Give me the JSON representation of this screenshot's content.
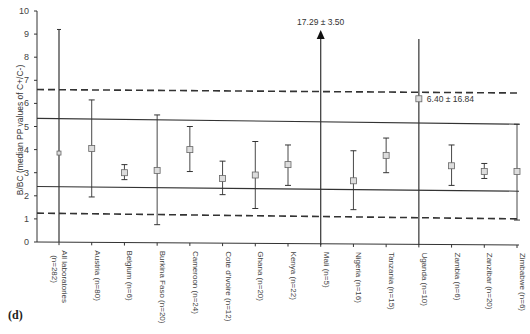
{
  "panel_label": "(d)",
  "chart_data": {
    "type": "scatter",
    "subtype": "point-with-error-bars",
    "title": "",
    "xlabel": "",
    "ylabel": "B/BC (median PP values of C+/C-)",
    "ylim": [
      0,
      10
    ],
    "yticks": [
      0,
      1,
      2,
      3,
      4,
      5,
      6,
      7,
      8,
      9,
      10
    ],
    "grid": false,
    "categories": [
      "All laboratories (n=282)",
      "Austria (n=80)",
      "Belgium (n=6)",
      "Burkina Faso (n=20)",
      "Cameroon (n=24)",
      "Cote d'Ivoire (n=12)",
      "Ghana (n=20)",
      "Kenya (n=22)",
      "Mali (n=5)",
      "Nigeria (n=16)",
      "Tanzania (n=15)",
      "Uganda (n=10)",
      "Zambia (n=6)",
      "Zanzibar (n=20)",
      "Zimbabwe (n=6)"
    ],
    "values": [
      3.85,
      4.05,
      3.0,
      3.1,
      4.0,
      2.75,
      2.9,
      3.35,
      17.29,
      2.65,
      3.75,
      6.2,
      3.3,
      3.05,
      3.05
    ],
    "err_low": [
      0.0,
      1.95,
      2.7,
      0.75,
      3.05,
      2.05,
      1.45,
      2.45,
      13.79,
      1.4,
      3.0,
      0.0,
      2.45,
      2.75,
      0.95
    ],
    "err_high": [
      9.2,
      6.15,
      3.35,
      5.5,
      5.0,
      3.5,
      4.35,
      4.2,
      10.0,
      3.95,
      4.5,
      10.0,
      4.2,
      3.4,
      5.1
    ],
    "annotations": [
      {
        "category": "Mali (n=5)",
        "text": "17.29 ± 3.50",
        "note": "off-scale, shown with arrow"
      },
      {
        "category": "Uganda (n=10)",
        "text": "6.40 ± 16.84"
      }
    ],
    "reference_lines": [
      {
        "style": "dashed",
        "y_start": 6.6,
        "y_end": 6.45
      },
      {
        "style": "solid",
        "y_start": 5.35,
        "y_end": 5.1
      },
      {
        "style": "solid",
        "y_start": 2.4,
        "y_end": 2.2
      },
      {
        "style": "dashed",
        "y_start": 1.25,
        "y_end": 1.0
      }
    ]
  }
}
